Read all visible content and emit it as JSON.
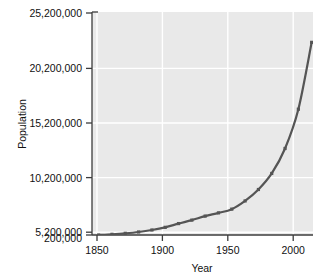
{
  "chart_data": {
    "type": "line",
    "title": "",
    "xlabel": "Year",
    "ylabel": "Population",
    "xlim": [
      1845,
      2011
    ],
    "ylim": [
      200000,
      25200000
    ],
    "grid": true,
    "legend": null,
    "xticks": [
      1850,
      1900,
      1950,
      2000
    ],
    "xtick_labels": [
      "1850",
      "1900",
      "1950",
      "2000"
    ],
    "yticks": [
      200000,
      5200000,
      10200000,
      15200000,
      20200000,
      25200000
    ],
    "ytick_labels": [
      "200,000",
      "5,200,000",
      "10,200,000",
      "15,200,000",
      "20,200,000",
      "25,200,000"
    ],
    "series": [
      {
        "name": "Population",
        "color": "#555555",
        "marker": "square",
        "x": [
          1850,
          1860,
          1870,
          1880,
          1890,
          1900,
          1910,
          1920,
          1930,
          1940,
          1950,
          1960,
          1970,
          1980,
          1990,
          2000,
          2010
        ],
        "values": [
          200000,
          280000,
          390000,
          540000,
          760000,
          1060000,
          1480000,
          1870000,
          2320000,
          2680000,
          3100000,
          4020000,
          5300000,
          7100000,
          9900000,
          14300000,
          21800000
        ]
      }
    ],
    "colors": {
      "plot_background": "#e9e9e9",
      "figure_background": "#ffffff",
      "gridline": "#ffffff",
      "axis": "#3c3c3c",
      "line": "#555555",
      "text": "#111111"
    }
  }
}
